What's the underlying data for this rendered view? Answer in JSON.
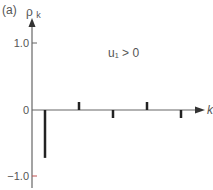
{
  "panel_label": "(a)",
  "annotation": "u₁ > 0",
  "colors": {
    "axis": "#666666",
    "bar": "#222222",
    "tick_neg": "#c05050"
  },
  "chart_data": {
    "type": "bar",
    "title": "(a)",
    "xlabel": "k",
    "ylabel": "ρk",
    "ylim": [
      -1.0,
      1.0
    ],
    "yticks": [
      1.0,
      0,
      -1.0
    ],
    "ytick_labels": [
      "1.0",
      "0",
      "−1.0"
    ],
    "categories": [
      1,
      2,
      3,
      4,
      5
    ],
    "values": [
      -0.72,
      0.12,
      -0.12,
      0.12,
      -0.12
    ],
    "annotations": [
      "u₁ > 0"
    ],
    "grid": false,
    "legend": null
  }
}
